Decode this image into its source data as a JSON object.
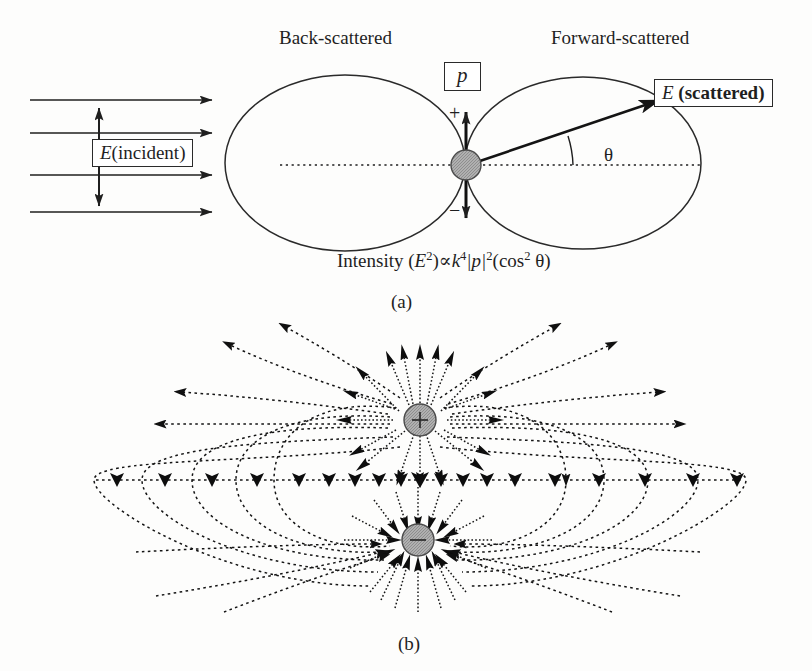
{
  "figure": {
    "panel_a": {
      "label_back": "Back-scattered",
      "label_forward": "Forward-scattered",
      "label_incident": "E(incident)",
      "label_incident_italic": "E",
      "label_incident_rest": "(incident)",
      "label_scattered_italic": "E",
      "label_scattered_bold": " (scattered)",
      "dipole_moment_label": "p",
      "charge_plus": "+",
      "charge_minus": "−",
      "angle_label": "θ",
      "formula": {
        "lead": "Intensity (",
        "e": "E",
        "e_exp": "2",
        "prop": ")∝",
        "k": "k",
        "k_exp": "4",
        "p_abs": "|p|",
        "p_exp": "2",
        "cos_open": "(cos",
        "cos_exp": "2",
        "theta_close": " θ)",
        "plain": "Intensity (E2)∝k4|p|2(cos2 θ)"
      },
      "caption": "(a)",
      "incident_ray_count": 4,
      "scatter_angle_deg": 25
    },
    "panel_b": {
      "charge_plus": "+",
      "charge_minus": "−",
      "caption": "(b)"
    },
    "colors": {
      "ink": "#1f1f1f",
      "line": "#2a2a2a",
      "charge_fill": "#a8a8a8",
      "charge_stroke": "#4a4a4a",
      "background": "#fdfdfc"
    }
  }
}
